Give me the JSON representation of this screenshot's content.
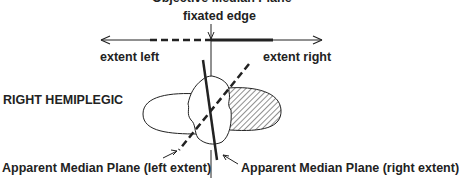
{
  "diagram": {
    "title": "Objective Median Plane",
    "fixated_label": "fixated edge",
    "extent_left_label": "extent left",
    "extent_right_label": "extent right",
    "condition_label": "RIGHT HEMIPLEGIC",
    "apparent_left_label": "Apparent Median Plane (left extent)",
    "apparent_right_label": "Apparent Median Plane (right extent)",
    "colors": {
      "ink": "#222222",
      "background": "#ffffff"
    },
    "elements": [
      {
        "name": "horizontal-extent-line",
        "style": "thin line with arrows both ends, dashed left segment, thick solid right segment"
      },
      {
        "name": "objective-median-plane-line",
        "style": "thin vertical line"
      },
      {
        "name": "apparent-median-plane-right",
        "style": "thick solid tilted line"
      },
      {
        "name": "apparent-median-plane-left",
        "style": "thick dashed tilted line"
      },
      {
        "name": "head-outline",
        "style": "irregular oval (top-down head)"
      },
      {
        "name": "left-lobe",
        "style": "open outline"
      },
      {
        "name": "right-lobe",
        "style": "hatched fill"
      }
    ]
  }
}
